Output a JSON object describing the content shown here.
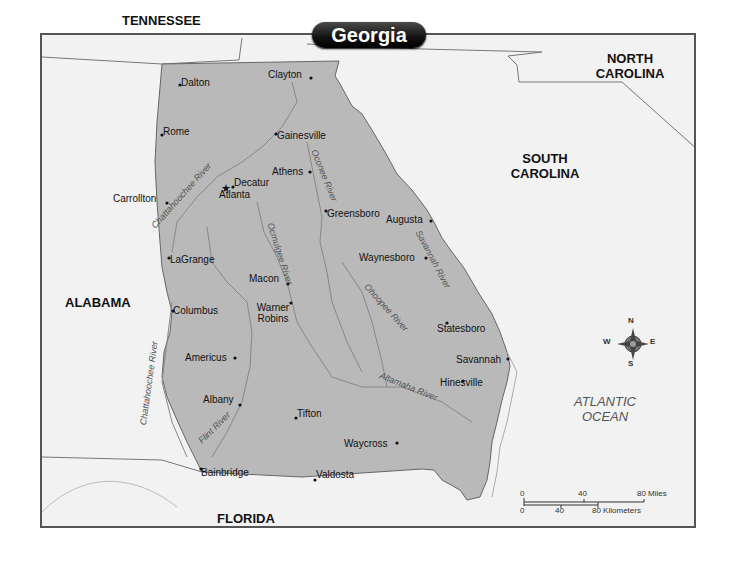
{
  "map": {
    "title": "Georgia",
    "states": {
      "tennessee": "TENNESSEE",
      "north_carolina": "NORTH CAROLINA",
      "south_carolina": "SOUTH CAROLINA",
      "alabama": "ALABAMA",
      "florida": "FLORIDA"
    },
    "ocean": "ATLANTIC OCEAN",
    "cities": [
      {
        "name": "Dalton"
      },
      {
        "name": "Clayton"
      },
      {
        "name": "Rome"
      },
      {
        "name": "Gainesville"
      },
      {
        "name": "Athens"
      },
      {
        "name": "Decatur"
      },
      {
        "name": "Atlanta",
        "capital": true
      },
      {
        "name": "Carrollton"
      },
      {
        "name": "Greensboro"
      },
      {
        "name": "Augusta"
      },
      {
        "name": "LaGrange"
      },
      {
        "name": "Waynesboro"
      },
      {
        "name": "Macon"
      },
      {
        "name": "Warner Robins"
      },
      {
        "name": "Columbus"
      },
      {
        "name": "Statesboro"
      },
      {
        "name": "Americus"
      },
      {
        "name": "Savannah"
      },
      {
        "name": "Hinesville"
      },
      {
        "name": "Albany"
      },
      {
        "name": "Tifton"
      },
      {
        "name": "Waycross"
      },
      {
        "name": "Bainbridge"
      },
      {
        "name": "Valdosta"
      }
    ],
    "rivers": [
      "Chattahoochee River",
      "Oconee River",
      "Ocmulgee River",
      "Savannah River",
      "Ohoopee River",
      "Altamaha River",
      "Chattahoochee River",
      "Flint River"
    ],
    "compass": {
      "n": "N",
      "s": "S",
      "e": "E",
      "w": "W"
    },
    "scale": {
      "miles": [
        "0",
        "40",
        "80 Miles"
      ],
      "km": [
        "0",
        "40",
        "80 Kilometers"
      ]
    }
  }
}
